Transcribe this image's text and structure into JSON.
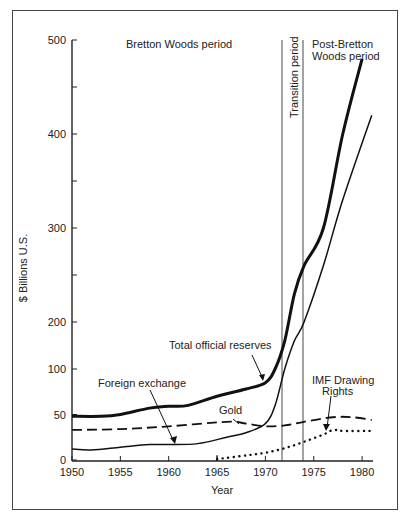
{
  "chart_data": {
    "type": "line",
    "title": "",
    "xlabel": "Year",
    "ylabel": "$ Billions U.S.",
    "xlim": [
      1950,
      1981
    ],
    "ylim": [
      0,
      500
    ],
    "y_scale_note": "broken/non-linear axis: 0-100 expanded, 100-200 compressed, 200-500 regular",
    "x_ticks": [
      "1950",
      "1955",
      "1960",
      "1965",
      "1970",
      "1975",
      "1980"
    ],
    "y_ticks": [
      "0",
      "50",
      "100",
      "200",
      "300",
      "400",
      "500"
    ],
    "grid": false,
    "annotations": {
      "bretton_woods": "Bretton Woods period",
      "transition": "Transition period",
      "post_bretton_1": "Post-Bretton",
      "post_bretton_2": "Woods period",
      "total_label": "Total official reserves",
      "fx_label": "Foreign exchange",
      "gold_label": "Gold",
      "imf_label_1": "IMF Drawing",
      "imf_label_2": "Rights"
    },
    "period_boundaries": [
      1971.7,
      1973.8
    ],
    "series": [
      {
        "name": "Total official reserves",
        "style": "thick solid",
        "x": [
          1950,
          1953,
          1955,
          1958,
          1960,
          1962,
          1965,
          1968,
          1970,
          1971,
          1972,
          1973,
          1974,
          1976,
          1978,
          1980
        ],
        "values": [
          48,
          48,
          50,
          57,
          59,
          60,
          70,
          78,
          85,
          100,
          160,
          230,
          260,
          300,
          400,
          480
        ]
      },
      {
        "name": "Foreign exchange",
        "style": "thin solid",
        "x": [
          1950,
          1952,
          1955,
          1958,
          1960,
          1963,
          1966,
          1968,
          1970,
          1971,
          1972,
          1973,
          1974,
          1976,
          1978,
          1981
        ],
        "values": [
          12,
          11,
          14,
          17,
          17,
          18,
          25,
          30,
          40,
          60,
          100,
          160,
          200,
          260,
          330,
          420
        ]
      },
      {
        "name": "Gold",
        "style": "dashed",
        "x": [
          1950,
          1955,
          1960,
          1966,
          1968,
          1970,
          1972,
          1974,
          1977,
          1979,
          1981
        ],
        "values": [
          33,
          34,
          37,
          42,
          40,
          37,
          38,
          42,
          47,
          47,
          44
        ]
      },
      {
        "name": "IMF Drawing Rights",
        "style": "dotted",
        "x": [
          1965,
          1968,
          1970,
          1972,
          1974,
          1976,
          1977,
          1978,
          1981
        ],
        "values": [
          1,
          5,
          8,
          13,
          20,
          28,
          33,
          32,
          32
        ]
      }
    ]
  }
}
